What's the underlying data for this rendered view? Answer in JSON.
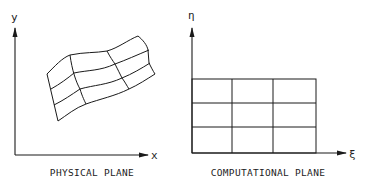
{
  "figure": {
    "panels": [
      {
        "id": "physical",
        "caption": "PHYSICAL PLANE",
        "x_axis_label": "x",
        "y_axis_label": "y",
        "grid": {
          "rows": 3,
          "cols": 3,
          "shape": "curvilinear"
        }
      },
      {
        "id": "computational",
        "caption": "COMPUTATIONAL PLANE",
        "x_axis_label": "ξ",
        "y_axis_label": "η",
        "grid": {
          "rows": 3,
          "cols": 3,
          "shape": "rectangular"
        }
      }
    ],
    "colors": {
      "ink": "#1a1a1a",
      "background": "#ffffff"
    }
  }
}
